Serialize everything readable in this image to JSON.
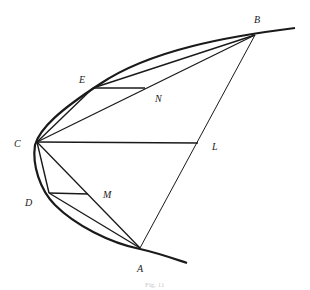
{
  "figure": {
    "type": "parabola-segment-quadrature",
    "caption": "Fig. 11",
    "stroke_color": "#1a1a1a",
    "points": {
      "A": {
        "label": "A",
        "x": 140,
        "y": 248,
        "label_x": 137,
        "label_y": 272
      },
      "B": {
        "label": "B",
        "x": 255,
        "y": 35,
        "label_x": 254,
        "label_y": 23
      },
      "C": {
        "label": "C",
        "x": 37,
        "y": 142,
        "label_x": 14,
        "label_y": 147
      },
      "D": {
        "label": "D",
        "x": 49,
        "y": 193,
        "label_x": 25,
        "label_y": 206
      },
      "E": {
        "label": "E",
        "x": 93,
        "y": 88,
        "label_x": 79,
        "label_y": 83
      },
      "L": {
        "label": "L",
        "x": 198,
        "y": 143,
        "label_x": 212,
        "label_y": 150
      },
      "M": {
        "label": "M",
        "x": 88,
        "y": 194,
        "label_x": 103,
        "label_y": 198
      },
      "N": {
        "label": "N",
        "x": 145,
        "y": 88,
        "label_x": 155,
        "label_y": 102
      }
    },
    "segments": [
      [
        "A",
        "B"
      ],
      [
        "C",
        "L"
      ],
      [
        "C",
        "B"
      ],
      [
        "C",
        "A"
      ],
      [
        "C",
        "E"
      ],
      [
        "E",
        "B"
      ],
      [
        "E",
        "N"
      ],
      [
        "C",
        "D"
      ],
      [
        "D",
        "A"
      ],
      [
        "D",
        "M"
      ]
    ]
  }
}
